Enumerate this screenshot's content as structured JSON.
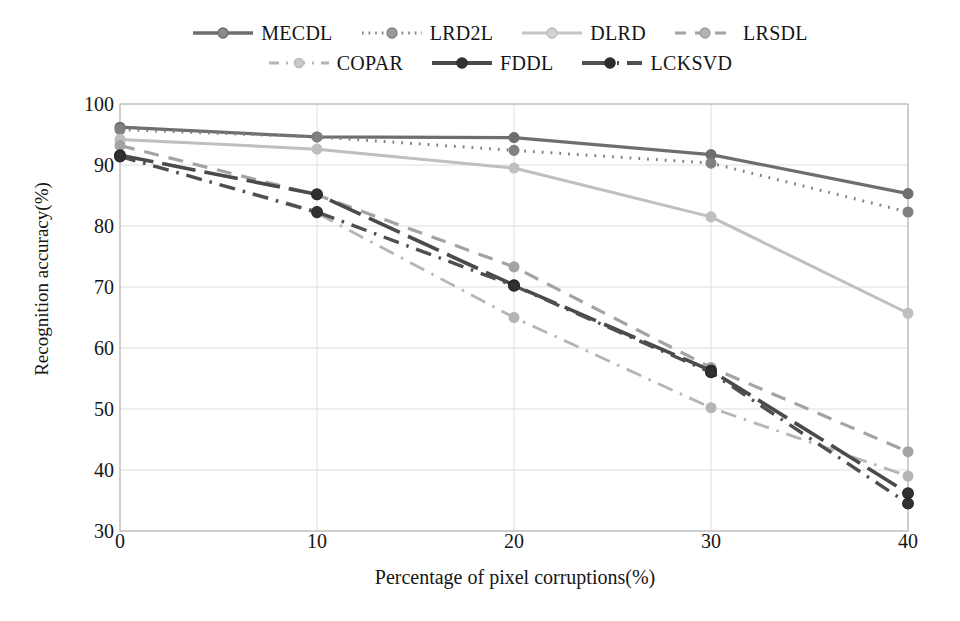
{
  "chart_data": {
    "type": "line",
    "title": "",
    "xlabel": "Percentage of pixel corruptions(%)",
    "ylabel": "Recognition accuracy(%)",
    "x": [
      0,
      10,
      20,
      30,
      40
    ],
    "xtick_labels": [
      "0",
      "10",
      "20",
      "30",
      "40"
    ],
    "ytick_labels": [
      "30",
      "40",
      "50",
      "60",
      "70",
      "80",
      "90",
      "100"
    ],
    "xlim": [
      0,
      40
    ],
    "ylim": [
      30,
      100
    ],
    "grid": true,
    "legend_position": "top",
    "series": [
      {
        "name": "MECDL",
        "values": [
          96.2,
          94.6,
          94.5,
          91.7,
          85.3
        ],
        "color": "#6e6e6e",
        "dash": "none",
        "width": 3.2,
        "marker": "circle"
      },
      {
        "name": "LRD2L",
        "values": [
          95.8,
          94.6,
          92.4,
          90.3,
          82.3
        ],
        "color": "#808080",
        "dash": "dotted",
        "width": 3.0,
        "marker": "circle"
      },
      {
        "name": "DLRD",
        "values": [
          94.2,
          92.6,
          89.5,
          81.5,
          65.7
        ],
        "color": "#bfbfbf",
        "dash": "none",
        "width": 3.0,
        "marker": "circle"
      },
      {
        "name": "LRSDL",
        "values": [
          93.2,
          85.1,
          73.3,
          56.8,
          43.0
        ],
        "color": "#a3a3a3",
        "dash": "dashed",
        "width": 3.2,
        "marker": "circle"
      },
      {
        "name": "COPAR",
        "values": [
          91.5,
          82.1,
          65.0,
          50.2,
          39.0
        ],
        "color": "#b5b5b5",
        "dash": "dashdot",
        "width": 2.8,
        "marker": "circle"
      },
      {
        "name": "FDDL",
        "values": [
          91.6,
          85.2,
          70.3,
          56.3,
          36.2
        ],
        "color": "#4a4a4a",
        "dash": "longdash",
        "width": 3.6,
        "marker": "circle"
      },
      {
        "name": "LCKSVD",
        "values": [
          91.4,
          82.3,
          70.2,
          56.0,
          34.5
        ],
        "color": "#4f4f4f",
        "dash": "dashdot",
        "width": 3.4,
        "marker": "circle"
      }
    ]
  },
  "legend": {
    "rows": [
      [
        {
          "label": "MECDL",
          "sample": "solid-line-marker-sample"
        },
        {
          "label": "LRD2L",
          "sample": "dotted-line-marker-sample"
        },
        {
          "label": "DLRD",
          "sample": "light-solid-line-marker-sample"
        },
        {
          "label": "LRSDL",
          "sample": "dashed-line-marker-sample"
        }
      ],
      [
        {
          "label": "COPAR",
          "sample": "dashdot-line-marker-sample"
        },
        {
          "label": "FDDL",
          "sample": "bold-dash-line-marker-sample"
        },
        {
          "label": "LCKSVD",
          "sample": "bold-dashdot-line-marker-sample"
        }
      ]
    ]
  },
  "axes": {
    "y_title": "Recognition accuracy(%)",
    "x_title": "Percentage of pixel corruptions(%)",
    "y_ticks": [
      "100",
      "90",
      "80",
      "70",
      "60",
      "50",
      "40",
      "30"
    ],
    "x_ticks": [
      "0",
      "10",
      "20",
      "30",
      "40"
    ]
  },
  "colors": {
    "plot_border": "#b9b9b9",
    "gridline": "#dedede",
    "text": "#161616",
    "background": "#ffffff"
  }
}
